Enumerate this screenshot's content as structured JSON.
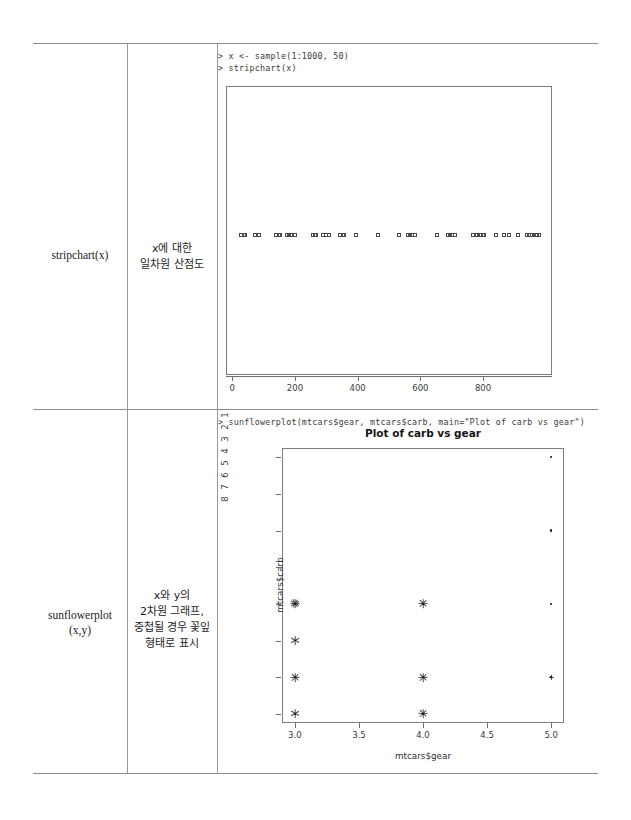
{
  "page": {
    "type": "r-graphics-reference-table",
    "columns": [
      "function",
      "description",
      "example"
    ]
  },
  "rows": [
    {
      "function": "stripchart(x)",
      "description_lines": [
        "x에 대한",
        "일차원 산점도"
      ],
      "console": "> x <- sample(1:1000, 50)\n> stripchart(x)"
    },
    {
      "function_lines": [
        "sunflowerplot",
        "(x,y)"
      ],
      "description_lines": [
        "x와 y의",
        "2차원 그래프,",
        "중첩될 경우 꽃잎",
        "형태로 표시"
      ],
      "console": "> sunflowerplot(mtcars$gear, mtcars$carb, main=\"Plot of carb vs gear\")"
    }
  ],
  "chart_data": [
    {
      "type": "scatter",
      "name": "stripchart",
      "title": "",
      "xlabel": "",
      "ylabel": "",
      "xlim": [
        -20,
        1020
      ],
      "xticks": [
        "0",
        "200",
        "400",
        "600",
        "800"
      ],
      "xtick_values": [
        0,
        200,
        400,
        600,
        800
      ],
      "grid": false,
      "legend": "none",
      "n": 50,
      "x": [
        28,
        40,
        72,
        84,
        140,
        152,
        176,
        188,
        200,
        256,
        268,
        288,
        308,
        344,
        356,
        396,
        464,
        532,
        560,
        572,
        584,
        652,
        688,
        700,
        712,
        768,
        780,
        792,
        804,
        840,
        868,
        884,
        912,
        940,
        956,
        964,
        972,
        980,
        36,
        148,
        182,
        264,
        300,
        352,
        568,
        696,
        776,
        800,
        948,
        968
      ],
      "jitter": 0
    },
    {
      "type": "scatter",
      "name": "sunflowerplot",
      "title": "Plot of carb vs gear",
      "xlabel": "mtcars$gear",
      "ylabel": "mtcars$carb",
      "xlim": [
        2.9,
        5.1
      ],
      "ylim": [
        0.75,
        8.25
      ],
      "xticks": [
        "3.0",
        "3.5",
        "4.0",
        "4.5",
        "5.0"
      ],
      "xtick_values": [
        3.0,
        3.5,
        4.0,
        4.5,
        5.0
      ],
      "yticks": [
        "1",
        "2",
        "3",
        "4",
        "5",
        "6",
        "7",
        "8"
      ],
      "ytick_values": [
        1,
        2,
        3,
        4,
        5,
        6,
        7,
        8
      ],
      "grid": false,
      "legend": "none",
      "points": [
        {
          "x": 3,
          "y": 1,
          "count": 3
        },
        {
          "x": 3,
          "y": 2,
          "count": 4
        },
        {
          "x": 3,
          "y": 3,
          "count": 3
        },
        {
          "x": 3,
          "y": 4,
          "count": 6
        },
        {
          "x": 4,
          "y": 1,
          "count": 4
        },
        {
          "x": 4,
          "y": 2,
          "count": 4
        },
        {
          "x": 4,
          "y": 4,
          "count": 4
        },
        {
          "x": 5,
          "y": 2,
          "count": 2
        },
        {
          "x": 5,
          "y": 4,
          "count": 1
        },
        {
          "x": 5,
          "y": 6,
          "count": 1
        },
        {
          "x": 5,
          "y": 8,
          "count": 1
        }
      ]
    }
  ]
}
